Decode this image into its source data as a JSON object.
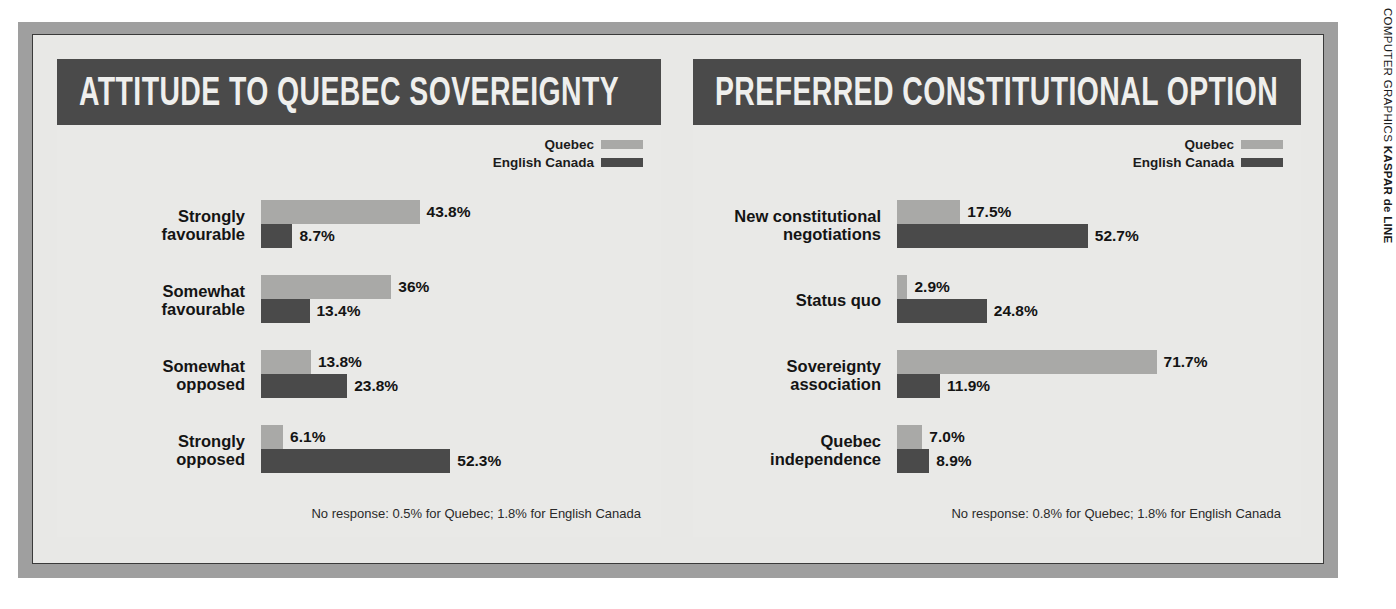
{
  "credit": {
    "prefix": "COMPUTER GRAPHICS",
    "author": "KASPAR de LINE"
  },
  "legend": {
    "quebec_label": "Quebec",
    "english_label": "English Canada",
    "quebec_color": "#a9a9a7",
    "english_color": "#4a4a4a"
  },
  "panels": [
    {
      "title": "ATTITUDE TO QUEBEC SOVEREIGNTY",
      "footnote": "No response: 0.5% for Quebec; 1.8% for English Canada",
      "rows": [
        {
          "label": "Strongly\nfavourable",
          "quebec": "43.8%",
          "english": "8.7%"
        },
        {
          "label": "Somewhat\nfavourable",
          "quebec": "36%",
          "english": "13.4%"
        },
        {
          "label": "Somewhat\nopposed",
          "quebec": "13.8%",
          "english": "23.8%"
        },
        {
          "label": "Strongly\nopposed",
          "quebec": "6.1%",
          "english": "52.3%"
        }
      ]
    },
    {
      "title": "PREFERRED CONSTITUTIONAL OPTION",
      "footnote": "No response: 0.8% for Quebec; 1.8% for English Canada",
      "rows": [
        {
          "label": "New constitutional\nnegotiations",
          "quebec": "17.5%",
          "english": "52.7%"
        },
        {
          "label": "Status quo",
          "quebec": "2.9%",
          "english": "24.8%"
        },
        {
          "label": "Sovereignty\nassociation",
          "quebec": "71.7%",
          "english": "11.9%"
        },
        {
          "label": "Quebec\nindependence",
          "quebec": "7.0%",
          "english": "8.9%"
        }
      ]
    }
  ],
  "chart_data": [
    {
      "type": "bar",
      "title": "ATTITUDE TO QUEBEC SOVEREIGNTY",
      "orientation": "horizontal",
      "categories": [
        "Strongly favourable",
        "Somewhat favourable",
        "Somewhat opposed",
        "Strongly opposed"
      ],
      "series": [
        {
          "name": "Quebec",
          "values": [
            43.8,
            36.0,
            13.8,
            6.1
          ],
          "color": "#a9a9a7"
        },
        {
          "name": "English Canada",
          "values": [
            8.7,
            13.4,
            23.8,
            52.3
          ],
          "color": "#4a4a4a"
        }
      ],
      "data_labels": [
        [
          "43.8%",
          "8.7%"
        ],
        [
          "36%",
          "13.4%"
        ],
        [
          "13.8%",
          "23.8%"
        ],
        [
          "6.1%",
          "52.3%"
        ]
      ],
      "xlabel": "",
      "ylabel": "",
      "xlim": [
        0,
        75
      ],
      "units": "percent",
      "grid": false,
      "legend_position": "top-right",
      "annotation": "No response: 0.5% for Quebec; 1.8% for English Canada"
    },
    {
      "type": "bar",
      "title": "PREFERRED CONSTITUTIONAL OPTION",
      "orientation": "horizontal",
      "categories": [
        "New constitutional negotiations",
        "Status quo",
        "Sovereignty association",
        "Quebec independence"
      ],
      "series": [
        {
          "name": "Quebec",
          "values": [
            17.5,
            2.9,
            71.7,
            7.0
          ],
          "color": "#a9a9a7"
        },
        {
          "name": "English Canada",
          "values": [
            52.7,
            24.8,
            11.9,
            8.9
          ],
          "color": "#4a4a4a"
        }
      ],
      "data_labels": [
        [
          "17.5%",
          "52.7%"
        ],
        [
          "2.9%",
          "24.8%"
        ],
        [
          "71.7%",
          "11.9%"
        ],
        [
          "7.0%",
          "8.9%"
        ]
      ],
      "xlabel": "",
      "ylabel": "",
      "xlim": [
        0,
        75
      ],
      "units": "percent",
      "grid": false,
      "legend_position": "top-right",
      "annotation": "No response: 0.8% for Quebec; 1.8% for English Canada"
    }
  ],
  "scale": {
    "px_per_percent": 3.62,
    "label_column_width": 196
  }
}
